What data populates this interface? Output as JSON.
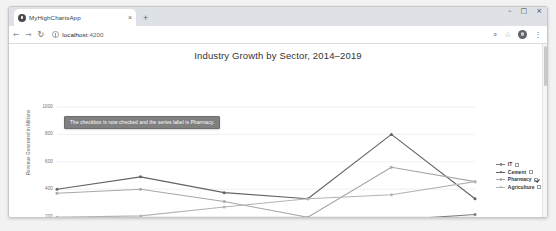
{
  "browser": {
    "tab_title": "MyHighChartsApp",
    "tab_close_label": "×",
    "new_tab_label": "+",
    "window_minimize": "–",
    "window_maximize": "□",
    "window_close": "×",
    "back_label": "←",
    "forward_label": "→",
    "reload_label": "↻",
    "url_host": "localhost",
    "url_port": ":4200",
    "zoom_icon_label": "⌕",
    "bookmark_icon_label": "☆",
    "menu_label": "⋮"
  },
  "annotation": {
    "text": "The checkbox is now checked and the series label is Pharmacy."
  },
  "chart_data": {
    "type": "line",
    "title": "Industry Growth by Sector, 2014–2019",
    "xlabel": "",
    "ylabel": "Revenue Generated in Millions",
    "categories": [
      "2014",
      "2015",
      "2016",
      "2017",
      "2018",
      "2019"
    ],
    "ylim": [
      0,
      1000
    ],
    "yticks": [
      0,
      200,
      400,
      600,
      800,
      1000
    ],
    "ytick_labels": [
      "0",
      "200",
      "400",
      "600",
      "800",
      "1000"
    ],
    "grid": true,
    "legend_position": "right",
    "series": [
      {
        "name": "IT",
        "color": "#7f7f7f",
        "checked": false,
        "values": [
          190,
          140,
          100,
          170,
          175,
          215
        ]
      },
      {
        "name": "Cement",
        "color": "#636363",
        "checked": false,
        "values": [
          400,
          490,
          375,
          330,
          800,
          330
        ]
      },
      {
        "name": "Pharmacy",
        "color": "#a8a8a8",
        "checked": true,
        "values": [
          370,
          400,
          310,
          195,
          560,
          455
        ]
      },
      {
        "name": "Agriculture",
        "color": "#b4b4b4",
        "checked": false,
        "values": [
          195,
          205,
          270,
          330,
          360,
          455
        ]
      }
    ]
  }
}
